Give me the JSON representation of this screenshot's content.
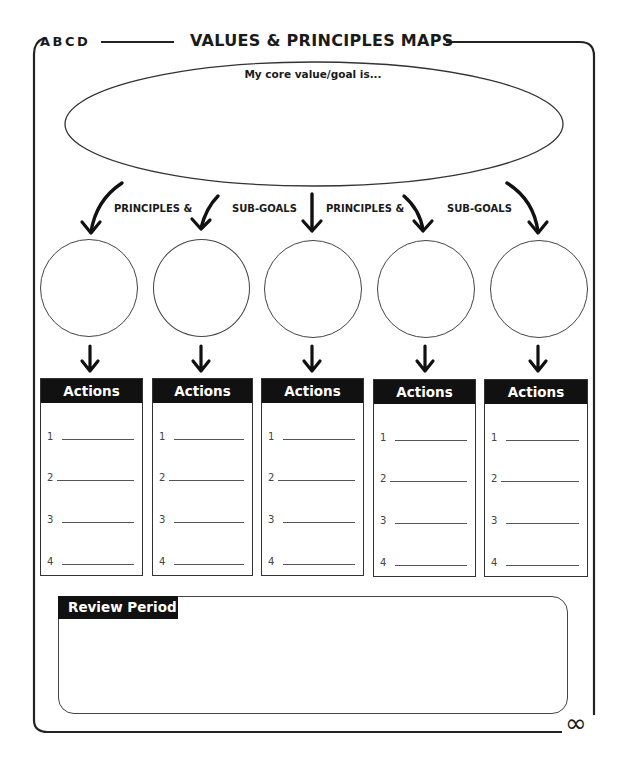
{
  "header": {
    "brand": "ABCD",
    "title": "VALUES & PRINCIPLES MAPS"
  },
  "core_value": {
    "prompt": "My core value/goal is...",
    "value": ""
  },
  "connector_labels": [
    "PRINCIPLES &",
    "SUB-GOALS",
    "PRINCIPLES &",
    "SUB-GOALS"
  ],
  "principles": [
    {
      "value": ""
    },
    {
      "value": ""
    },
    {
      "value": ""
    },
    {
      "value": ""
    },
    {
      "value": ""
    }
  ],
  "action_columns": [
    {
      "header": "Actions",
      "items": [
        {
          "num": "1",
          "value": ""
        },
        {
          "num": "2",
          "value": ""
        },
        {
          "num": "3",
          "value": ""
        },
        {
          "num": "4",
          "value": ""
        }
      ]
    },
    {
      "header": "Actions",
      "items": [
        {
          "num": "1",
          "value": ""
        },
        {
          "num": "2",
          "value": ""
        },
        {
          "num": "3",
          "value": ""
        },
        {
          "num": "4",
          "value": ""
        }
      ]
    },
    {
      "header": "Actions",
      "items": [
        {
          "num": "1",
          "value": ""
        },
        {
          "num": "2",
          "value": ""
        },
        {
          "num": "3",
          "value": ""
        },
        {
          "num": "4",
          "value": ""
        }
      ]
    },
    {
      "header": "Actions",
      "items": [
        {
          "num": "1",
          "value": ""
        },
        {
          "num": "2",
          "value": ""
        },
        {
          "num": "3",
          "value": ""
        },
        {
          "num": "4",
          "value": ""
        }
      ]
    },
    {
      "header": "Actions",
      "items": [
        {
          "num": "1",
          "value": ""
        },
        {
          "num": "2",
          "value": ""
        },
        {
          "num": "3",
          "value": ""
        },
        {
          "num": "4",
          "value": ""
        }
      ]
    }
  ],
  "review": {
    "header": "Review Period",
    "value": ""
  },
  "footer": {
    "symbol": "∞"
  },
  "colors": {
    "ink": "#111111",
    "line": "#444444",
    "background": "#ffffff"
  }
}
